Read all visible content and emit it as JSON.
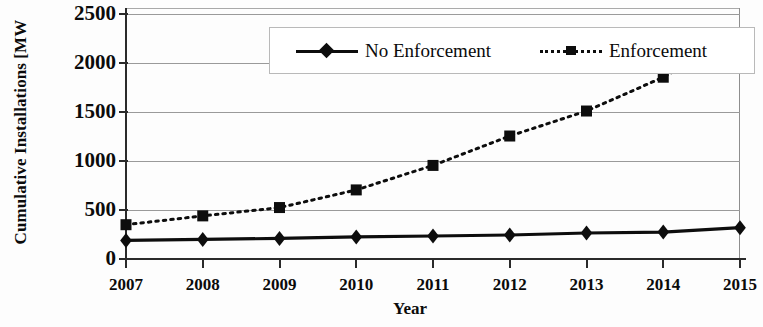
{
  "chart_data": {
    "type": "line",
    "title": "",
    "xlabel": "Year",
    "ylabel": "Cumulative Installations [MW",
    "x": [
      2007,
      2008,
      2009,
      2010,
      2011,
      2012,
      2013,
      2014,
      2015
    ],
    "categories": [
      "2007",
      "2008",
      "2009",
      "2010",
      "2011",
      "2012",
      "2013",
      "2014",
      "2015"
    ],
    "series": [
      {
        "name": "No Enforcement",
        "marker": "diamond",
        "linestyle": "solid",
        "color": "#0d0d0d",
        "values": [
          190,
          200,
          210,
          225,
          235,
          245,
          265,
          275,
          320
        ]
      },
      {
        "name": "Enforcement",
        "marker": "square",
        "linestyle": "dotted",
        "color": "#0d0d0d",
        "values": [
          350,
          440,
          525,
          705,
          955,
          1255,
          1510,
          1855,
          2285
        ]
      }
    ],
    "ylim": [
      0,
      2500
    ],
    "yticks": [
      0,
      500,
      1000,
      1500,
      2000,
      2500
    ],
    "ytick_labels": [
      "0",
      "500",
      "1000",
      "1500",
      "2000",
      "2500"
    ],
    "xlim": [
      2007,
      2015
    ],
    "grid": true,
    "grid_axis": "y",
    "legend_position": "top-center",
    "legend_entries": [
      "No Enforcement",
      "Enforcement"
    ]
  },
  "axes": {
    "y_title": "Cumulative Installations [MW",
    "x_title": "Year"
  },
  "legend": {
    "no_enforcement_label": "No Enforcement",
    "enforcement_label": "Enforcement"
  }
}
